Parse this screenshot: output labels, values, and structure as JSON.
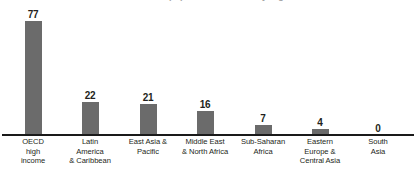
{
  "chart_data": {
    "type": "bar",
    "title": "Percent of the population covered by registries",
    "xlabel": "",
    "ylabel": "",
    "ylim": [
      0,
      80
    ],
    "grid": false,
    "legend": null,
    "categories": [
      "OECD high income",
      "Latin America & Caribbean",
      "East Asia & Pacific",
      "Middle East & North Africa",
      "Sub-Saharan Africa",
      "Eastern Europe & Central Asia",
      "South Asia"
    ],
    "category_lines": [
      [
        "OECD",
        "high",
        "income"
      ],
      [
        "Latin",
        "America",
        "& Caribbean"
      ],
      [
        "East Asia &",
        "Pacific"
      ],
      [
        "Middle East",
        "& North Africa"
      ],
      [
        "Sub-Saharan",
        "Africa"
      ],
      [
        "Eastern",
        "Europe &",
        "Central Asia"
      ],
      [
        "South",
        "Asia"
      ]
    ],
    "values": [
      77,
      22,
      21,
      16,
      7,
      4,
      0
    ],
    "value_labels": [
      "77",
      "22",
      "21",
      "16",
      "7",
      "4",
      "0"
    ],
    "bar_color": "#6b6b6b",
    "axis_color": "#1a1a1a",
    "label_color": "#231f20",
    "background_color": "#ffffff"
  }
}
